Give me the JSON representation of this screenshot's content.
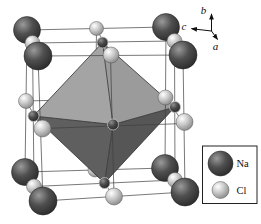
{
  "axes": {
    "up": "b",
    "left": "c",
    "diagonal": "a"
  },
  "legend": {
    "items": [
      {
        "label": "Na",
        "kind": "na"
      },
      {
        "label": "Cl",
        "kind": "cl"
      }
    ]
  },
  "colors": {
    "background": "#ffffff",
    "text": "#111111",
    "line": "#3f3f3f",
    "edge": "#2f2f2f",
    "na_hi": "#9a9a9a",
    "na_mid": "#4f4f4f",
    "na_lo": "#262626",
    "cl_hi": "#ffffff",
    "cl_mid": "#c9c9c9",
    "cl_lo": "#808080",
    "fc_hi": "#8f8f8f",
    "fc_mid": "#4a4a4a",
    "fc_lo": "#222222",
    "octa_upper_left": "#a4a4a4",
    "octa_upper_right": "#9b9b9b",
    "octa_lower_left": "#5f5f5f",
    "octa_lower_right": "#565656"
  },
  "atoms": [
    {
      "name": "atom-cl-edge-bottom-back",
      "kind": "cl",
      "layer": "behind",
      "x": 95,
      "y": 170,
      "r": 7
    },
    {
      "name": "atom-na-corner-back-top-left",
      "kind": "na",
      "layer": "main",
      "x": 27,
      "y": 30,
      "r": 13.5
    },
    {
      "name": "atom-na-corner-back-top-right",
      "kind": "na",
      "layer": "main",
      "x": 166,
      "y": 27,
      "r": 13.5
    },
    {
      "name": "atom-na-corner-back-bottom-left",
      "kind": "na",
      "layer": "main",
      "x": 25,
      "y": 172,
      "r": 13.5
    },
    {
      "name": "atom-na-corner-back-bottom-right",
      "kind": "na",
      "layer": "main",
      "x": 165,
      "y": 168,
      "r": 13.5
    },
    {
      "name": "atom-cl-edge-top-back",
      "kind": "cl",
      "layer": "main",
      "x": 96.5,
      "y": 28.5,
      "r": 7
    },
    {
      "name": "atom-cl-edge-top-left",
      "kind": "cl",
      "layer": "main",
      "x": 32.5,
      "y": 43,
      "r": 7.5
    },
    {
      "name": "atom-cl-edge-top-right",
      "kind": "cl",
      "layer": "main",
      "x": 174.5,
      "y": 41,
      "r": 7.5
    },
    {
      "name": "atom-cl-edge-left-back",
      "kind": "cl",
      "layer": "main",
      "x": 26,
      "y": 101,
      "r": 7.5
    },
    {
      "name": "atom-cl-edge-right-back",
      "kind": "cl",
      "layer": "main",
      "x": 165.5,
      "y": 97.5,
      "r": 7.5
    },
    {
      "name": "atom-cl-edge-bottom-left",
      "kind": "cl",
      "layer": "main",
      "x": 34,
      "y": 186.5,
      "r": 7.5
    },
    {
      "name": "atom-cl-edge-bottom-right",
      "kind": "cl",
      "layer": "main",
      "x": 175,
      "y": 180,
      "r": 7.5
    },
    {
      "name": "atom-cl-edge-top-front",
      "kind": "cl",
      "layer": "main",
      "x": 111,
      "y": 55,
      "r": 8
    },
    {
      "name": "atom-cl-edge-left-front",
      "kind": "cl",
      "layer": "main",
      "x": 42.5,
      "y": 128.5,
      "r": 8.5
    },
    {
      "name": "atom-cl-edge-right-front",
      "kind": "cl",
      "layer": "main",
      "x": 184.5,
      "y": 122,
      "r": 8.5
    },
    {
      "name": "atom-cl-edge-bottom-front",
      "kind": "cl",
      "layer": "main",
      "x": 114,
      "y": 196.5,
      "r": 8.5
    },
    {
      "name": "atom-na-corner-front-top-left",
      "kind": "na",
      "layer": "main",
      "x": 38,
      "y": 56,
      "r": 14
    },
    {
      "name": "atom-na-corner-front-top-right",
      "kind": "na",
      "layer": "main",
      "x": 183,
      "y": 55,
      "r": 14
    },
    {
      "name": "atom-na-corner-front-bottom-left",
      "kind": "na",
      "layer": "main",
      "x": 43,
      "y": 201,
      "r": 14
    },
    {
      "name": "atom-na-corner-front-bottom-right",
      "kind": "na",
      "layer": "main",
      "x": 185,
      "y": 192,
      "r": 14
    },
    {
      "name": "atom-face-center-top",
      "kind": "fc",
      "layer": "main",
      "x": 102.5,
      "y": 42.5,
      "r": 5.5
    },
    {
      "name": "atom-face-center-left",
      "kind": "fc",
      "layer": "main",
      "x": 33.5,
      "y": 116,
      "r": 5.5
    },
    {
      "name": "atom-face-center-right",
      "kind": "fc",
      "layer": "main",
      "x": 175,
      "y": 107,
      "r": 5.5
    },
    {
      "name": "atom-face-center-bottom",
      "kind": "fc",
      "layer": "main",
      "x": 104.5,
      "y": 183,
      "r": 5.5
    },
    {
      "name": "atom-face-center-front",
      "kind": "fc",
      "layer": "main",
      "x": 113,
      "y": 124.5,
      "r": 5.5
    }
  ]
}
